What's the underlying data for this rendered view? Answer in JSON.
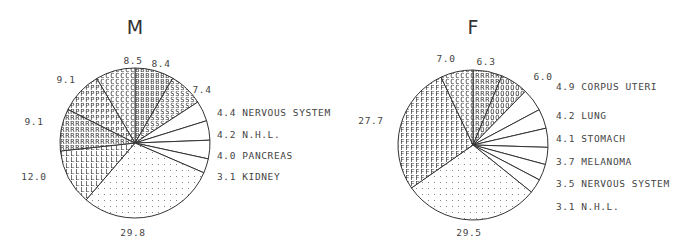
{
  "chart_data": [
    {
      "type": "pie",
      "title": "M",
      "start": "12 o'clock, clockwise",
      "slices": [
        {
          "value": 8.4,
          "label": "",
          "pattern": "B"
        },
        {
          "value": 7.4,
          "label": "",
          "pattern": "S"
        },
        {
          "value": 4.4,
          "label": "NERVOUS SYSTEM",
          "pattern": "none"
        },
        {
          "value": 4.2,
          "label": "N.H.L.",
          "pattern": "none"
        },
        {
          "value": 4.0,
          "label": "PANCREAS",
          "pattern": "none"
        },
        {
          "value": 3.1,
          "label": "KIDNEY",
          "pattern": "none"
        },
        {
          "value": 29.8,
          "label": "",
          "pattern": "dots"
        },
        {
          "value": 12.0,
          "label": "",
          "pattern": "L"
        },
        {
          "value": 9.1,
          "label": "",
          "pattern": "R"
        },
        {
          "value": 9.1,
          "label": "",
          "pattern": "P"
        },
        {
          "value": 8.5,
          "label": "",
          "pattern": "C"
        }
      ]
    },
    {
      "type": "pie",
      "title": "F",
      "start": "12 o'clock, clockwise",
      "slices": [
        {
          "value": 6.3,
          "label": "",
          "pattern": "R"
        },
        {
          "value": 6.0,
          "label": "",
          "pattern": "O"
        },
        {
          "value": 4.9,
          "label": "CORPUS UTERI",
          "pattern": "none"
        },
        {
          "value": 4.2,
          "label": "LUNG",
          "pattern": "none"
        },
        {
          "value": 4.1,
          "label": "STOMACH",
          "pattern": "none"
        },
        {
          "value": 3.7,
          "label": "MELANOMA",
          "pattern": "none"
        },
        {
          "value": 3.5,
          "label": "NERVOUS SYSTEM",
          "pattern": "none"
        },
        {
          "value": 3.1,
          "label": "N.H.L.",
          "pattern": "none"
        },
        {
          "value": 29.5,
          "label": "",
          "pattern": "dots"
        },
        {
          "value": 27.7,
          "label": "",
          "pattern": "F"
        },
        {
          "value": 7.0,
          "label": "",
          "pattern": "C"
        }
      ]
    }
  ],
  "charts": [
    {
      "cx": 135,
      "cy": 143,
      "r": 75
    },
    {
      "cx": 473,
      "cy": 145,
      "r": 75
    }
  ]
}
